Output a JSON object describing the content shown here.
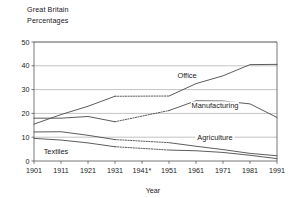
{
  "header": {
    "line1": "Great Britain",
    "line2": "Percentages"
  },
  "chart_data": {
    "type": "line",
    "title": "Great Britain",
    "subtitle": "Percentages",
    "xlabel": "Year",
    "ylabel": "",
    "xlim": [
      1901,
      1991
    ],
    "ylim": [
      0,
      50
    ],
    "yticks": [
      0,
      10,
      20,
      30,
      40,
      50
    ],
    "grid": true,
    "grid_axis": "y",
    "legend": "inline-labels",
    "categories": [
      "1901",
      "1911",
      "1921",
      "1931",
      "1941*",
      "1951",
      "1961",
      "1971",
      "1981",
      "1991"
    ],
    "x": [
      1901,
      1911,
      1921,
      1931,
      1941,
      1951,
      1961,
      1971,
      1981,
      1991
    ],
    "note": "1941* census not taken; 1931-1951 segments shown dotted (interpolated)",
    "series": [
      {
        "name": "Office",
        "label": "Office",
        "values": [
          15.5,
          19.5,
          23.0,
          27.2,
          null,
          27.3,
          32.5,
          35.8,
          40.5,
          40.6
        ],
        "interpolated_between": [
          "1931",
          "1951"
        ],
        "color": "#4a4a4a"
      },
      {
        "name": "Manufacturing",
        "label": "Manufacturing",
        "values": [
          18.0,
          18.0,
          18.7,
          16.5,
          null,
          21.2,
          25.3,
          25.2,
          24.0,
          18.3
        ],
        "interpolated_between": [
          "1931",
          "1951"
        ],
        "color": "#4a4a4a"
      },
      {
        "name": "Agriculture",
        "label": "Agriculture",
        "values": [
          12.2,
          12.3,
          10.8,
          9.0,
          null,
          7.7,
          6.2,
          4.8,
          3.2,
          2.2
        ],
        "interpolated_between": [
          "1931",
          "1951"
        ],
        "color": "#4a4a4a"
      },
      {
        "name": "Textiles",
        "label": "Textiles",
        "values": [
          9.5,
          8.8,
          7.6,
          6.0,
          null,
          4.6,
          4.3,
          3.6,
          2.4,
          1.0
        ],
        "interpolated_between": [
          "1931",
          "1951"
        ],
        "color": "#4a4a4a"
      }
    ]
  },
  "yticklabels": [
    "0",
    "10",
    "20",
    "30",
    "40",
    "50"
  ],
  "xticklabels": [
    "1901",
    "1911",
    "1921",
    "1931",
    "1941*",
    "1951",
    "1961",
    "1971",
    "1981",
    "1991"
  ],
  "axis": {
    "x_title": "Year"
  },
  "series_labels": {
    "office": "Office",
    "manufacturing": "Manufacturing",
    "agriculture": "Agriculture",
    "textiles": "Textiles"
  }
}
